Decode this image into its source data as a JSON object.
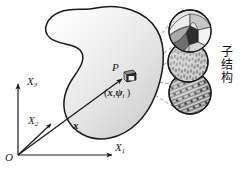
{
  "figure": {
    "axes": {
      "origin_label": "O",
      "x1_label": "X",
      "x1_sub": "1",
      "x2_label": "X",
      "x2_sub": "2",
      "x3_label": "X",
      "x3_sub": "3"
    },
    "vector": {
      "label": "x"
    },
    "point": {
      "label": "P",
      "coordinate_pair_open": "(",
      "coordinate_pair_x": "x",
      "coordinate_pair_comma": ",",
      "coordinate_pair_psi": "ψ",
      "coordinate_pair_sub": "i",
      "coordinate_pair_close": " )"
    },
    "annotation": {
      "substructure_text": "子结构"
    },
    "colors": {
      "outline": "#1a1a1a",
      "body_fill_light": "#ffffff",
      "body_fill_mid": "#e4e4e4",
      "body_fill_dark": "#c9c9c9",
      "dashed_leader": "#777777",
      "circle_outline": "#1a1a1a",
      "grain_light": "#dcdcdc",
      "grain_mid": "#9a9a9a",
      "grain_dark": "#3a3a3a",
      "hatch_fill": "#cfcfcf",
      "dot_fill": "#2a2a2a",
      "cube_dark": "#2b2b2b"
    },
    "substructure_circles": [
      {
        "name": "grain-structure-circle",
        "pattern": "irregular-grain-patches"
      },
      {
        "name": "fiber-hatch-circle",
        "pattern": "dashed-line-hatching"
      },
      {
        "name": "particle-hatch-circle",
        "pattern": "diagonal-hatch-with-dots"
      }
    ]
  }
}
